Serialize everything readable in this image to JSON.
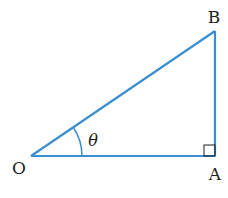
{
  "diagram": {
    "type": "right-triangle",
    "line_color": "#3a8fd1",
    "text_color": "#231f20",
    "vertices": {
      "O": {
        "label": "O",
        "x": 31,
        "y": 156
      },
      "A": {
        "label": "A",
        "x": 215,
        "y": 156
      },
      "B": {
        "label": "B",
        "x": 215,
        "y": 31
      }
    },
    "angle_label": "θ",
    "right_angle_at": "A"
  }
}
